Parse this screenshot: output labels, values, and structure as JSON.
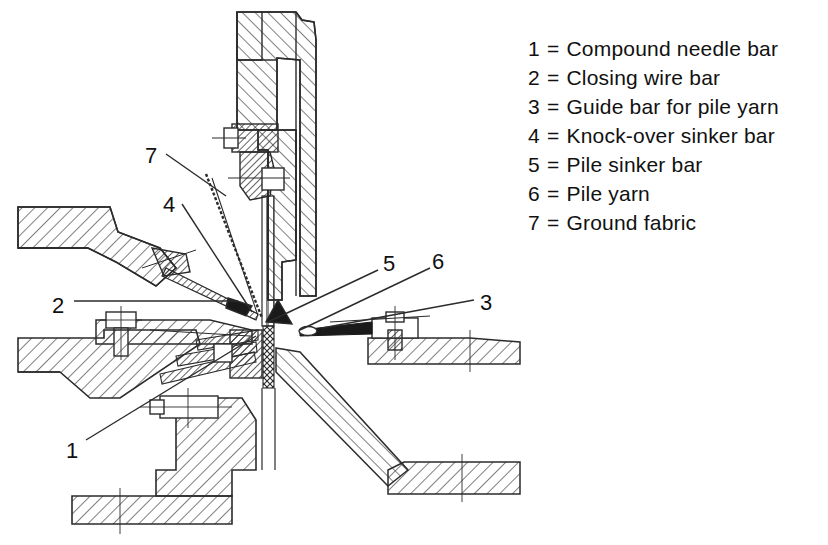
{
  "figure": {
    "kind": "technical-cross-section"
  },
  "legend": {
    "rows": [
      {
        "key": "1",
        "eq": "=",
        "label": "Compound needle bar"
      },
      {
        "key": "2",
        "eq": "=",
        "label": "Closing wire bar"
      },
      {
        "key": "3",
        "eq": "=",
        "label": "Guide bar for pile yarn"
      },
      {
        "key": "4",
        "eq": "=",
        "label": "Knock-over sinker bar"
      },
      {
        "key": "5",
        "eq": "=",
        "label": "Pile sinker bar"
      },
      {
        "key": "6",
        "eq": "=",
        "label": "Pile yarn"
      },
      {
        "key": "7",
        "eq": "=",
        "label": "Ground fabric"
      }
    ]
  },
  "callouts": [
    {
      "id": "callout-7",
      "text": "7",
      "x": 145,
      "y": 145
    },
    {
      "id": "callout-4",
      "text": "4",
      "x": 163,
      "y": 194
    },
    {
      "id": "callout-2",
      "text": "2",
      "x": 52,
      "y": 295
    },
    {
      "id": "callout-1",
      "text": "1",
      "x": 66,
      "y": 440
    },
    {
      "id": "callout-5",
      "text": "5",
      "x": 383,
      "y": 253
    },
    {
      "id": "callout-6",
      "text": "6",
      "x": 432,
      "y": 251
    },
    {
      "id": "callout-3",
      "text": "3",
      "x": 480,
      "y": 292
    }
  ],
  "colors": {
    "ink": "#111111",
    "line": "#2b2b2b",
    "hatch": "#3a3a3a",
    "fill_dark": "#1a1a1a",
    "paper": "#ffffff"
  }
}
